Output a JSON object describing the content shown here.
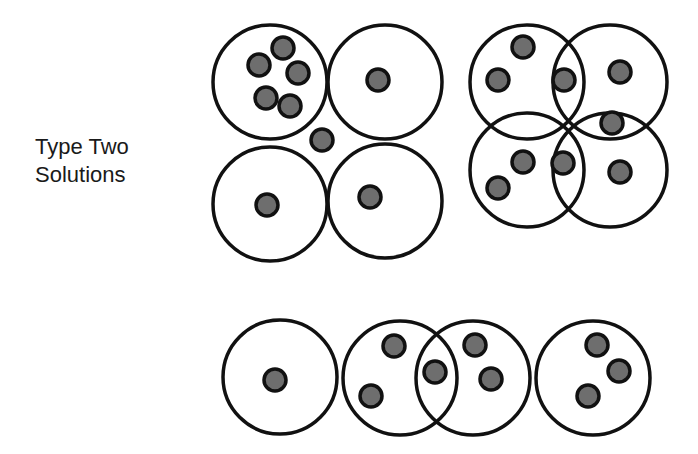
{
  "title": {
    "line1": "Type Two",
    "line2": "Solutions"
  },
  "colors": {
    "stroke": "#111111",
    "dot_fill": "#6e6e6e",
    "background": "#ffffff"
  },
  "circle_radius": 57,
  "dot_radius": 11,
  "groups": [
    {
      "name": "square-tangent-group",
      "circles": [
        [
          270,
          82
        ],
        [
          385,
          82
        ],
        [
          270,
          204
        ],
        [
          385,
          201
        ]
      ],
      "dots": [
        [
          283,
          48
        ],
        [
          259,
          65
        ],
        [
          298,
          73
        ],
        [
          266,
          98
        ],
        [
          290,
          106
        ],
        [
          378,
          80
        ],
        [
          322,
          140
        ],
        [
          267,
          205
        ],
        [
          370,
          197
        ]
      ]
    },
    {
      "name": "square-overlapping-group",
      "circles": [
        [
          527,
          82
        ],
        [
          610,
          82
        ],
        [
          527,
          170
        ],
        [
          610,
          170
        ]
      ],
      "dots": [
        [
          523,
          47
        ],
        [
          498,
          80
        ],
        [
          564,
          80
        ],
        [
          620,
          72
        ],
        [
          612,
          123
        ],
        [
          523,
          162
        ],
        [
          563,
          163
        ],
        [
          498,
          188
        ],
        [
          620,
          172
        ]
      ]
    },
    {
      "name": "row-group",
      "circles": [
        [
          280,
          377
        ],
        [
          400,
          378
        ],
        [
          473,
          378
        ],
        [
          593,
          378
        ]
      ],
      "dots": [
        [
          275,
          380
        ],
        [
          394,
          346
        ],
        [
          371,
          396
        ],
        [
          435,
          372
        ],
        [
          475,
          345
        ],
        [
          491,
          379
        ],
        [
          597,
          345
        ],
        [
          619,
          371
        ],
        [
          588,
          396
        ]
      ]
    }
  ]
}
